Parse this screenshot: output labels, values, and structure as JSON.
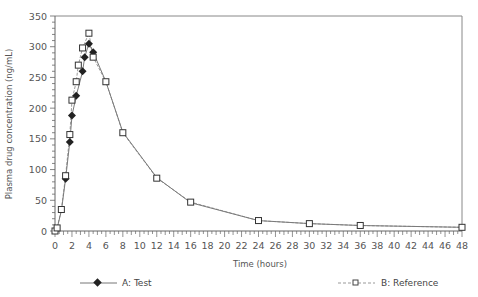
{
  "chart_data": {
    "type": "line",
    "title": "",
    "xlabel": "Time (hours)",
    "ylabel": "Plasma drug concentration (ng/mL)",
    "xlim": [
      0,
      48
    ],
    "ylim": [
      0,
      350
    ],
    "x_ticks": [
      0,
      2,
      4,
      6,
      8,
      10,
      12,
      14,
      16,
      18,
      20,
      22,
      24,
      26,
      28,
      30,
      32,
      34,
      36,
      38,
      40,
      42,
      44,
      46,
      48
    ],
    "y_ticks": [
      0,
      50,
      100,
      150,
      200,
      250,
      300,
      350
    ],
    "grid": false,
    "legend_position": "bottom",
    "series": [
      {
        "name": "A: Test",
        "marker": "diamond-filled",
        "line": "solid",
        "color": "#333333",
        "x": [
          0,
          0.25,
          0.75,
          1.25,
          1.75,
          2,
          2.5,
          3.25,
          3.5,
          4,
          4.5,
          6,
          8,
          12,
          16,
          24,
          30,
          36,
          48
        ],
        "y": [
          0,
          4,
          33,
          85,
          145,
          188,
          220,
          260,
          283,
          305,
          291,
          243,
          161,
          87,
          46,
          17,
          12,
          9,
          6
        ]
      },
      {
        "name": "B: Reference",
        "marker": "square-open",
        "line": "dashed",
        "color": "#555555",
        "x": [
          0,
          0.25,
          0.75,
          1.25,
          1.75,
          2,
          2.5,
          2.75,
          3.25,
          4,
          4.5,
          6,
          8,
          12,
          16,
          24,
          30,
          36,
          48
        ],
        "y": [
          0,
          5,
          35,
          90,
          157,
          213,
          243,
          270,
          298,
          322,
          283,
          243,
          160,
          86,
          47,
          17,
          12,
          9,
          6
        ]
      }
    ]
  },
  "labels": {
    "xlabel": "Time (hours)",
    "ylabel": "Plasma drug concentration (ng/mL)",
    "legend_a": "A: Test",
    "legend_b": "B: Reference"
  }
}
